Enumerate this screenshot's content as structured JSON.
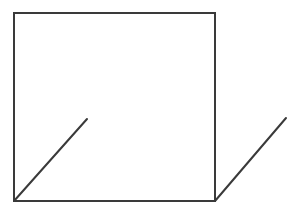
{
  "diagram": {
    "type": "line-drawing",
    "stroke_color": "#3a3a3a",
    "background_color": "#ffffff",
    "stroke_width": 2,
    "square": {
      "x": 14,
      "y": 13,
      "width": 201,
      "height": 188
    },
    "segments": [
      {
        "name": "diagonal-bottom-left",
        "x1": 14,
        "y1": 201,
        "x2": 87,
        "y2": 119
      },
      {
        "name": "diagonal-bottom-right",
        "x1": 215,
        "y1": 201,
        "x2": 286,
        "y2": 118
      }
    ]
  }
}
